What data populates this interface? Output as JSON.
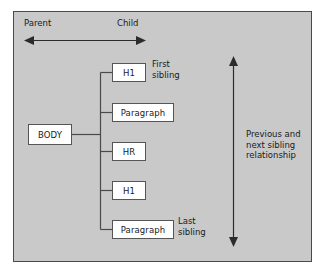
{
  "diagram": {
    "panel": {
      "background_color": "#c9c9c9",
      "border_color": "#4a4a4a"
    },
    "axis": {
      "parent_label": "Parent",
      "child_label": "Child",
      "arrow_direction": "double-headed-horizontal"
    },
    "root_node": {
      "label": "BODY"
    },
    "children": [
      {
        "label": "H1",
        "annotation": [
          "First",
          "sibling"
        ]
      },
      {
        "label": "Paragraph",
        "annotation": []
      },
      {
        "label": "HR",
        "annotation": []
      },
      {
        "label": "H1",
        "annotation": []
      },
      {
        "label": "Paragraph",
        "annotation": [
          "Last",
          "sibling"
        ]
      }
    ],
    "sibling_axis": {
      "lines": [
        "Previous and",
        "next sibling",
        "relationship"
      ],
      "arrow_direction": "double-headed-vertical"
    },
    "colors": {
      "node_fill": "#ffffff",
      "node_border": "#555555",
      "line": "#4a4a4a",
      "text": "#1a1a1a"
    }
  }
}
